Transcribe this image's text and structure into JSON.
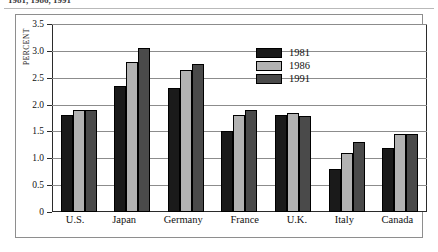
{
  "caption_remnant": "1981, 1986, 1991",
  "chart_data": {
    "type": "bar",
    "title": "",
    "xlabel": "",
    "ylabel": "PERCENT",
    "ylim": [
      0,
      3.5
    ],
    "grid": true,
    "legend_position": "inside-top-center",
    "categories": [
      "U.S.",
      "Japan",
      "Germany",
      "France",
      "U.K.",
      "Italy",
      "Canada"
    ],
    "ticks": [
      "0",
      "0.5",
      "1.0",
      "1.5",
      "2.0",
      "2.5",
      "3.0",
      "3.5"
    ],
    "tick_values": [
      0,
      0.5,
      1.0,
      1.5,
      2.0,
      2.5,
      3.0,
      3.5
    ],
    "series": [
      {
        "name": "1981",
        "color": "#1a1a1a",
        "values": [
          1.8,
          2.35,
          2.3,
          1.5,
          1.8,
          0.8,
          1.2
        ]
      },
      {
        "name": "1986",
        "color": "#b2b2b2",
        "values": [
          1.9,
          2.8,
          2.65,
          1.8,
          1.85,
          1.1,
          1.45
        ]
      },
      {
        "name": "1991",
        "color": "#4a4a4a",
        "values": [
          1.9,
          3.05,
          2.75,
          1.9,
          1.78,
          1.3,
          1.45
        ]
      }
    ]
  }
}
